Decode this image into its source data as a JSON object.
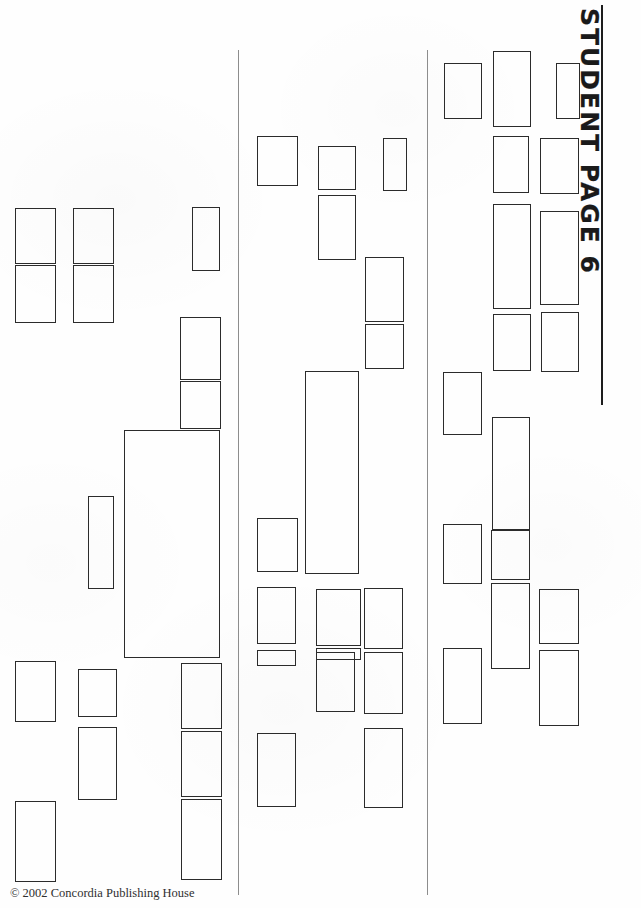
{
  "document": {
    "title": "STUDENT PAGE 6",
    "footer_credit": "© 2002 Concordia Publishing House",
    "page_number": "6",
    "kind": "blank-cutout-worksheet",
    "background_color": "#fefefe",
    "box_border_color": "#2b2b2b",
    "divider_color": "#8d8d8d",
    "title_color": "#1a1a1a",
    "width": 641,
    "height": 908
  },
  "dividers": [
    {
      "name": "divider-left",
      "x": 238,
      "y": 50,
      "height": 845
    },
    {
      "name": "divider-right",
      "x": 427,
      "y": 50,
      "height": 845
    }
  ],
  "title_rule": {
    "x": 601,
    "y": 5,
    "height": 400
  },
  "columns": [
    {
      "name": "column-left",
      "boxes": [
        {
          "x": 15,
          "y": 208,
          "w": 41,
          "h": 56
        },
        {
          "x": 73,
          "y": 208,
          "w": 41,
          "h": 56
        },
        {
          "x": 15,
          "y": 265,
          "w": 41,
          "h": 58
        },
        {
          "x": 73,
          "y": 265,
          "w": 41,
          "h": 58
        },
        {
          "x": 192,
          "y": 207,
          "w": 28,
          "h": 64
        },
        {
          "x": 180,
          "y": 317,
          "w": 41,
          "h": 63
        },
        {
          "x": 180,
          "y": 381,
          "w": 41,
          "h": 48
        },
        {
          "x": 124,
          "y": 430,
          "w": 96,
          "h": 228
        },
        {
          "x": 88,
          "y": 496,
          "w": 26,
          "h": 93
        },
        {
          "x": 15,
          "y": 661,
          "w": 41,
          "h": 61
        },
        {
          "x": 78,
          "y": 669,
          "w": 39,
          "h": 48
        },
        {
          "x": 78,
          "y": 727,
          "w": 39,
          "h": 73
        },
        {
          "x": 181,
          "y": 663,
          "w": 41,
          "h": 66
        },
        {
          "x": 181,
          "y": 731,
          "w": 41,
          "h": 66
        },
        {
          "x": 181,
          "y": 799,
          "w": 41,
          "h": 81
        },
        {
          "x": 15,
          "y": 801,
          "w": 41,
          "h": 81
        }
      ]
    },
    {
      "name": "column-middle",
      "boxes": [
        {
          "x": 257,
          "y": 136,
          "w": 41,
          "h": 50
        },
        {
          "x": 318,
          "y": 146,
          "w": 38,
          "h": 44
        },
        {
          "x": 383,
          "y": 138,
          "w": 24,
          "h": 53
        },
        {
          "x": 318,
          "y": 195,
          "w": 38,
          "h": 65
        },
        {
          "x": 365,
          "y": 257,
          "w": 39,
          "h": 65
        },
        {
          "x": 365,
          "y": 324,
          "w": 39,
          "h": 45
        },
        {
          "x": 305,
          "y": 371,
          "w": 54,
          "h": 203
        },
        {
          "x": 257,
          "y": 518,
          "w": 41,
          "h": 54
        },
        {
          "x": 257,
          "y": 587,
          "w": 39,
          "h": 57
        },
        {
          "x": 316,
          "y": 589,
          "w": 45,
          "h": 57
        },
        {
          "x": 364,
          "y": 588,
          "w": 39,
          "h": 61
        },
        {
          "x": 257,
          "y": 650,
          "w": 39,
          "h": 16
        },
        {
          "x": 316,
          "y": 648,
          "w": 45,
          "h": 12
        },
        {
          "x": 316,
          "y": 652,
          "w": 39,
          "h": 60
        },
        {
          "x": 364,
          "y": 652,
          "w": 39,
          "h": 62
        },
        {
          "x": 364,
          "y": 728,
          "w": 39,
          "h": 80
        },
        {
          "x": 257,
          "y": 733,
          "w": 39,
          "h": 74
        }
      ]
    },
    {
      "name": "column-right",
      "boxes": [
        {
          "x": 444,
          "y": 63,
          "w": 38,
          "h": 56
        },
        {
          "x": 493,
          "y": 51,
          "w": 38,
          "h": 76
        },
        {
          "x": 556,
          "y": 63,
          "w": 24,
          "h": 56
        },
        {
          "x": 493,
          "y": 136,
          "w": 36,
          "h": 57
        },
        {
          "x": 540,
          "y": 138,
          "w": 39,
          "h": 56
        },
        {
          "x": 493,
          "y": 204,
          "w": 38,
          "h": 105
        },
        {
          "x": 540,
          "y": 211,
          "w": 39,
          "h": 94
        },
        {
          "x": 493,
          "y": 314,
          "w": 38,
          "h": 57
        },
        {
          "x": 541,
          "y": 312,
          "w": 38,
          "h": 60
        },
        {
          "x": 443,
          "y": 372,
          "w": 39,
          "h": 63
        },
        {
          "x": 492,
          "y": 417,
          "w": 38,
          "h": 113
        },
        {
          "x": 443,
          "y": 524,
          "w": 39,
          "h": 60
        },
        {
          "x": 491,
          "y": 530,
          "w": 39,
          "h": 50
        },
        {
          "x": 491,
          "y": 583,
          "w": 39,
          "h": 86
        },
        {
          "x": 539,
          "y": 589,
          "w": 40,
          "h": 55
        },
        {
          "x": 443,
          "y": 648,
          "w": 39,
          "h": 76
        },
        {
          "x": 539,
          "y": 650,
          "w": 40,
          "h": 76
        }
      ]
    }
  ]
}
